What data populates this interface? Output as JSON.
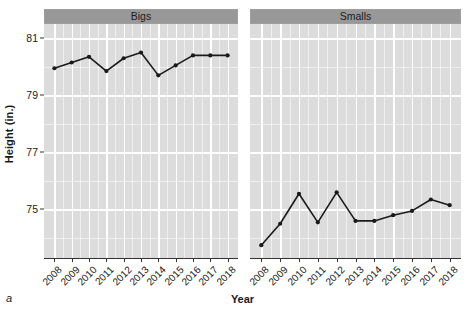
{
  "figure": {
    "panel_letter": "a",
    "y_axis_title": "Height (in.)",
    "x_axis_title": "Year"
  },
  "axes": {
    "y_ticks": [
      "81",
      "79",
      "77",
      "75"
    ],
    "x_ticks": [
      "2008",
      "2009",
      "2010",
      "2011",
      "2012",
      "2013",
      "2014",
      "2015",
      "2016",
      "2017",
      "2018"
    ]
  },
  "panels": [
    {
      "label": "Bigs"
    },
    {
      "label": "Smalls"
    }
  ],
  "colors": {
    "panel_background": "#dcdcdc",
    "strip_background": "#989898",
    "gridline": "#ffffff",
    "series": "#1a1a1a",
    "axis": "#333333",
    "text": "#1a1a1a"
  },
  "chart_data": {
    "type": "line",
    "title": "",
    "subtitle": "",
    "xlabel": "Year",
    "ylabel": "Height (in.)",
    "ylim": [
      73.3,
      81.5
    ],
    "yticks": [
      75,
      77,
      79,
      81
    ],
    "grid": true,
    "legend": false,
    "facets": [
      "Bigs",
      "Smalls"
    ],
    "x": [
      2008,
      2009,
      2010,
      2011,
      2012,
      2013,
      2014,
      2015,
      2016,
      2017,
      2018
    ],
    "series": [
      {
        "name": "Bigs",
        "facet": "Bigs",
        "values": [
          79.95,
          80.15,
          80.35,
          79.85,
          80.3,
          80.5,
          79.7,
          80.05,
          80.4,
          80.4,
          80.4
        ]
      },
      {
        "name": "Smalls",
        "facet": "Smalls",
        "values": [
          73.75,
          74.5,
          75.55,
          74.55,
          75.6,
          74.6,
          74.6,
          74.8,
          74.95,
          75.35,
          75.15
        ]
      }
    ]
  }
}
